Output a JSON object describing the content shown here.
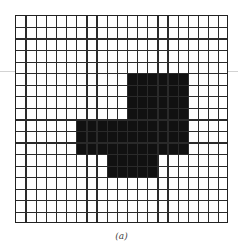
{
  "figure": {
    "caption": "(a)",
    "grid": {
      "columns": 21,
      "rows": 18,
      "line_color": "#2a2a2a",
      "fill_color": "#111111"
    },
    "filled_regions": [
      {
        "name": "upper-block",
        "col_start": 11,
        "col_end": 16,
        "row_start": 5,
        "row_end": 8
      },
      {
        "name": "middle-band",
        "col_start": 6,
        "col_end": 16,
        "row_start": 9,
        "row_end": 11
      },
      {
        "name": "lower-block",
        "col_start": 9,
        "col_end": 13,
        "row_start": 12,
        "row_end": 13
      }
    ]
  }
}
